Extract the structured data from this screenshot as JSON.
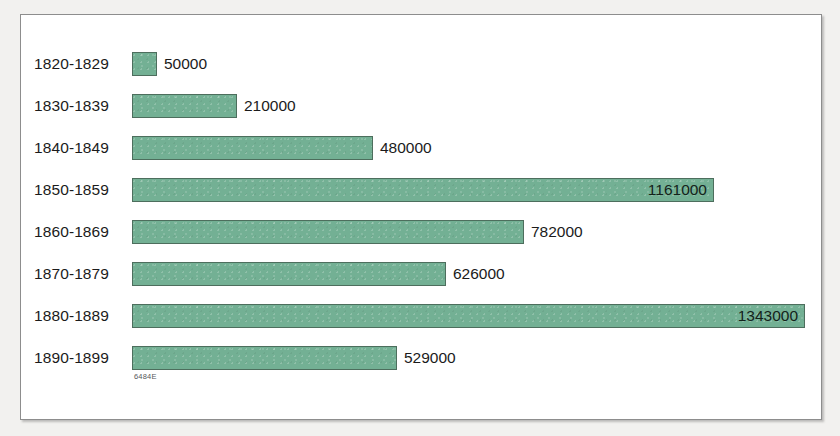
{
  "chart_data": {
    "type": "bar",
    "orientation": "horizontal",
    "title": "",
    "subtitle": "",
    "xlabel": "",
    "ylabel": "",
    "grid": false,
    "legend": null,
    "xlim": [
      0,
      1343000
    ],
    "categories": [
      "1820-1829",
      "1830-1839",
      "1840-1849",
      "1850-1859",
      "1860-1869",
      "1870-1879",
      "1880-1889",
      "1890-1899"
    ],
    "values": [
      50000,
      210000,
      480000,
      1161000,
      782000,
      626000,
      1343000,
      529000
    ],
    "value_labels": [
      "50000",
      "210000",
      "480000",
      "1161000",
      "782000",
      "626000",
      "1343000",
      "529000"
    ],
    "label_placement": [
      "outside",
      "outside",
      "outside",
      "inside",
      "outside",
      "outside",
      "inside",
      "outside"
    ],
    "bar_color": "#73b094",
    "bar_border_color": "#4d6e5d",
    "background_color": "#ffffff"
  },
  "footnote": {
    "source_code": "6484E"
  }
}
